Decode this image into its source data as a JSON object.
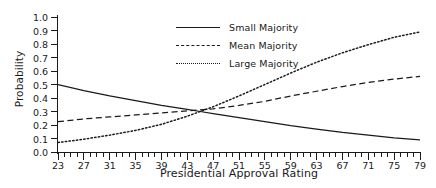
{
  "chart_data": {
    "type": "line",
    "title": "",
    "xlabel": "Presidential Approval Rating",
    "ylabel": "Probability",
    "xlim": [
      23,
      79
    ],
    "ylim": [
      0.0,
      1.0
    ],
    "grid": false,
    "legend_position": "top-right inside plot",
    "x_major_ticks": [
      23,
      27,
      31,
      35,
      39,
      43,
      47,
      51,
      55,
      59,
      63,
      67,
      71,
      75,
      79
    ],
    "x_minor_tick_step": 1,
    "y_ticks": [
      0.0,
      0.1,
      0.2,
      0.3,
      0.4,
      0.5,
      0.6,
      0.7,
      0.8,
      0.9,
      1.0
    ],
    "y_tick_labels": [
      "0.0",
      "0.1",
      "0.2",
      "0.3",
      "0.4",
      "0.5",
      "0.6",
      "0.7",
      "0.8",
      "0.9",
      "1.0"
    ],
    "x": [
      23,
      27,
      31,
      35,
      39,
      43,
      45,
      47,
      51,
      55,
      59,
      63,
      67,
      71,
      75,
      79
    ],
    "series": [
      {
        "name": "Small Majority",
        "style": "solid",
        "color": "#1a1a1a",
        "values": [
          0.5,
          0.455,
          0.415,
          0.38,
          0.345,
          0.315,
          0.3,
          0.285,
          0.255,
          0.225,
          0.195,
          0.17,
          0.145,
          0.125,
          0.105,
          0.09
        ]
      },
      {
        "name": "Mean Majority",
        "style": "dashed",
        "color": "#1a1a1a",
        "values": [
          0.225,
          0.245,
          0.26,
          0.275,
          0.29,
          0.305,
          0.312,
          0.32,
          0.345,
          0.375,
          0.415,
          0.45,
          0.485,
          0.515,
          0.54,
          0.56
        ]
      },
      {
        "name": "Large Majority",
        "style": "dotted",
        "color": "#1a1a1a",
        "values": [
          0.07,
          0.095,
          0.125,
          0.16,
          0.205,
          0.265,
          0.3,
          0.335,
          0.415,
          0.5,
          0.585,
          0.665,
          0.735,
          0.795,
          0.85,
          0.89
        ]
      }
    ]
  },
  "legend": {
    "items": [
      {
        "label": "Small Majority",
        "style": "solid"
      },
      {
        "label": "Mean Majority",
        "style": "dashed"
      },
      {
        "label": "Large Majority",
        "style": "dotted"
      }
    ]
  }
}
